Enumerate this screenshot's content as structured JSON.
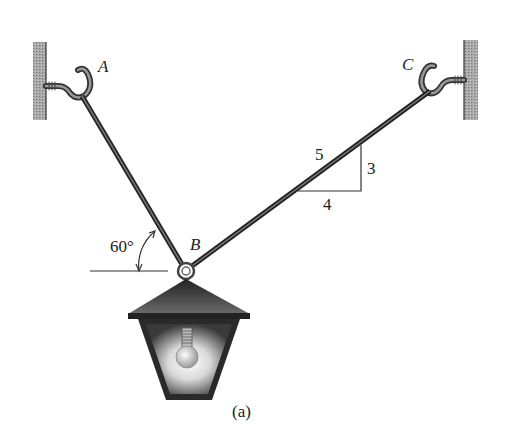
{
  "figure": {
    "caption": "(a)",
    "labels": {
      "point_a": "A",
      "point_b": "B",
      "point_c": "C",
      "angle": "60°",
      "slope_hyp": "5",
      "slope_rise": "3",
      "slope_run": "4"
    },
    "elements": {
      "cable_ab": "cable from wall hook A to ring B",
      "cable_bc": "cable from wall hook C to ring B",
      "lamp": "hanging lantern with light bulb"
    },
    "geometry": {
      "angle_ab_from_horizontal_deg": 60,
      "bc_slope": {
        "rise": 3,
        "run": 4,
        "hyp": 5
      }
    },
    "colors": {
      "ink": "#222222",
      "wall": "#9a9a9a",
      "cable": "#3a3a3a",
      "lamp_dark": "#333333"
    }
  }
}
